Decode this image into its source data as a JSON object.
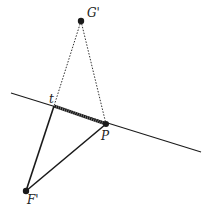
{
  "diagram": {
    "colors": {
      "stroke": "#1a1a1a",
      "background": "#ffffff"
    },
    "points": {
      "G": {
        "label": "G'",
        "x": 81,
        "y": 21
      },
      "t": {
        "label": "t",
        "x": 54,
        "y": 106
      },
      "P": {
        "label": "P",
        "x": 106,
        "y": 124
      },
      "F": {
        "label": "F'",
        "x": 26,
        "y": 191
      }
    },
    "line": {
      "x1": 11,
      "y1": 93,
      "x2": 201,
      "y2": 152
    },
    "labels": {
      "G": "G'",
      "t": "t",
      "P": "P",
      "F": "F'"
    }
  }
}
